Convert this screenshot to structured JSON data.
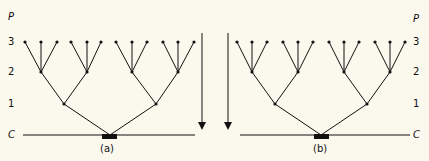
{
  "panels": [
    {
      "id": "a",
      "caption": "(a)",
      "axis_title": "P",
      "level_labels": [
        "3",
        "2",
        "1",
        "C"
      ],
      "arrow_direction": "down",
      "arrow_side": "right",
      "tree": {
        "root": "C",
        "levels": 3,
        "branching": [
          2,
          2,
          3
        ],
        "leaf_count": 12
      }
    },
    {
      "id": "b",
      "caption": "(b)",
      "axis_title": "P",
      "level_labels": [
        "3",
        "2",
        "1",
        "C"
      ],
      "arrow_direction": "down",
      "arrow_side": "left",
      "tree": {
        "root": "C",
        "levels": 3,
        "branching": [
          2,
          2,
          3
        ],
        "leaf_count": 12
      }
    }
  ],
  "colors": {
    "ink": "#111111",
    "paper": "#fbf9ee"
  }
}
